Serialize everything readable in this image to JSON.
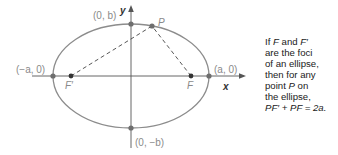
{
  "diagram": {
    "type": "ellipse-foci",
    "axes": {
      "x_label": "x",
      "y_label": "y"
    },
    "points": {
      "left_vertex": "(−a, 0)",
      "right_vertex": "(a, 0)",
      "top_vertex": "(0, b)",
      "bottom_vertex": "(0, −b)",
      "focus_left": "F′",
      "focus_right": "F",
      "point_on_ellipse": "P"
    }
  },
  "caption": {
    "lines": [
      "If F and F′",
      "are the foci",
      "of an ellipse,",
      "then for any",
      "point P on",
      "the ellipse,",
      "PF′ + PF = 2a."
    ],
    "parts": {
      "l1a": "If ",
      "l1F": "F",
      "l1b": " and ",
      "l1F2": "F′",
      "l2": "are the foci",
      "l3": "of an ellipse,",
      "l4": "then for any",
      "l5a": "point ",
      "l5P": "P",
      "l5b": " on",
      "l6": "the ellipse,",
      "l7": "PF′ + PF = 2a."
    }
  },
  "colors": {
    "curve": "#8c8c8c",
    "axis": "#555555",
    "point": "#6e6e6e",
    "text": "#1a1a1a"
  }
}
